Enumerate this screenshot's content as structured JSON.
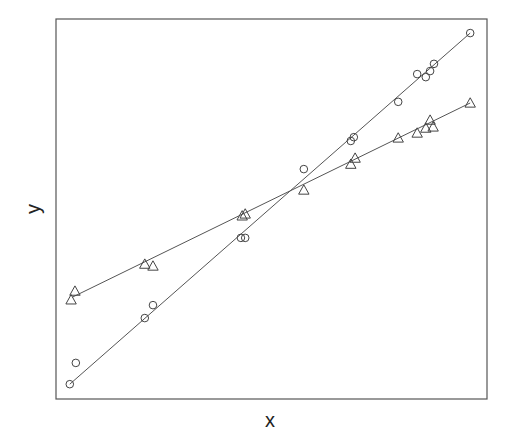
{
  "chart_data": {
    "type": "scatter",
    "title": "",
    "xlabel": "x",
    "ylabel": "y",
    "xlim": [
      0,
      1
    ],
    "ylim": [
      0,
      1
    ],
    "grid": false,
    "legend": null,
    "ticks": "none",
    "series": [
      {
        "name": "circles",
        "marker": "circle",
        "points": [
          [
            0.032,
            0.039
          ],
          [
            0.046,
            0.095
          ],
          [
            0.206,
            0.213
          ],
          [
            0.225,
            0.247
          ],
          [
            0.429,
            0.424
          ],
          [
            0.439,
            0.424
          ],
          [
            0.575,
            0.605
          ],
          [
            0.684,
            0.679
          ],
          [
            0.691,
            0.689
          ],
          [
            0.794,
            0.782
          ],
          [
            0.838,
            0.855
          ],
          [
            0.858,
            0.847
          ],
          [
            0.868,
            0.863
          ],
          [
            0.877,
            0.882
          ],
          [
            0.961,
            0.963
          ]
        ],
        "fit_line": [
          [
            0.032,
            0.039
          ],
          [
            0.961,
            0.963
          ]
        ]
      },
      {
        "name": "triangles",
        "marker": "triangle",
        "points": [
          [
            0.035,
            0.261
          ],
          [
            0.044,
            0.284
          ],
          [
            0.206,
            0.355
          ],
          [
            0.225,
            0.35
          ],
          [
            0.432,
            0.482
          ],
          [
            0.439,
            0.487
          ],
          [
            0.575,
            0.55
          ],
          [
            0.684,
            0.618
          ],
          [
            0.694,
            0.634
          ],
          [
            0.794,
            0.687
          ],
          [
            0.838,
            0.7
          ],
          [
            0.858,
            0.713
          ],
          [
            0.868,
            0.734
          ],
          [
            0.875,
            0.716
          ],
          [
            0.961,
            0.779
          ]
        ],
        "fit_line": [
          [
            0.038,
            0.268
          ],
          [
            0.961,
            0.779
          ]
        ]
      }
    ]
  },
  "colors": {
    "frame": "#555555",
    "marker": "#444444",
    "line": "#555555"
  }
}
